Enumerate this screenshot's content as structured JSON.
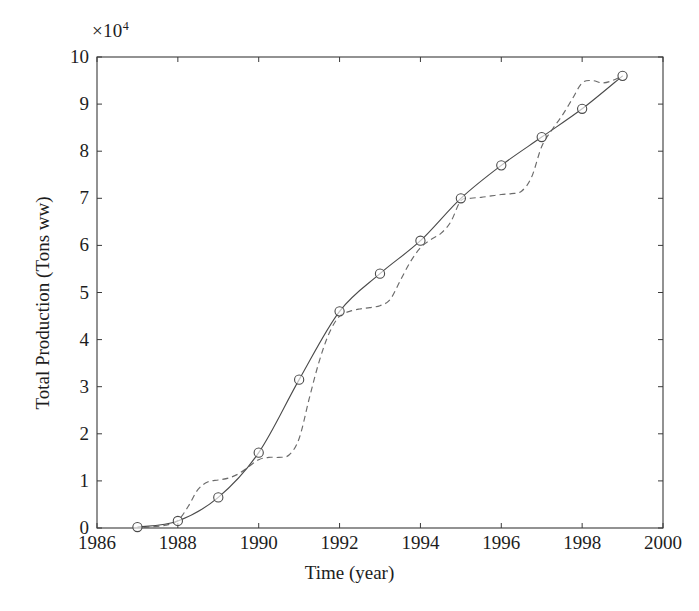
{
  "figure": {
    "exponent_label": "×10",
    "exponent_power": "4",
    "ylabel": "Total Production (Tons ww)",
    "xlabel": "Time (year)"
  },
  "chart_data": {
    "type": "line",
    "title": "",
    "xlabel": "Time (year)",
    "ylabel": "Total Production (Tons ww)",
    "y_multiplier": "×10^4",
    "xlim": [
      1986,
      2000
    ],
    "ylim": [
      0,
      10
    ],
    "xticks": [
      1986,
      1988,
      1990,
      1992,
      1994,
      1996,
      1998,
      2000
    ],
    "xtick_labels": [
      "1986",
      "1988",
      "1990",
      "1992",
      "1994",
      "1996",
      "1998",
      "2000"
    ],
    "yticks": [
      0,
      1,
      2,
      3,
      4,
      5,
      6,
      7,
      8,
      9,
      10
    ],
    "ytick_labels": [
      "0",
      "1",
      "2",
      "3",
      "4",
      "5",
      "6",
      "7",
      "8",
      "9",
      "10"
    ],
    "grid": false,
    "legend": null,
    "series": [
      {
        "name": "observed",
        "style": "solid-line-with-circle-markers",
        "marker": "circle-open",
        "color": "#4a4a4a",
        "x": [
          1987,
          1988,
          1989,
          1990,
          1991,
          1992,
          1993,
          1994,
          1995,
          1996,
          1997,
          1998,
          1999
        ],
        "values": [
          0.02,
          0.15,
          0.65,
          1.6,
          3.15,
          4.6,
          5.4,
          6.1,
          7.0,
          7.7,
          8.3,
          8.9,
          9.6
        ]
      },
      {
        "name": "model",
        "style": "dashed-line",
        "marker": "none",
        "color": "#6b6b6b",
        "x": [
          1986.9,
          1987.3,
          1987.7,
          1988.0,
          1988.25,
          1988.5,
          1988.75,
          1989.0,
          1989.25,
          1989.5,
          1989.75,
          1990.0,
          1990.25,
          1990.5,
          1990.75,
          1991.0,
          1991.25,
          1991.5,
          1991.75,
          1992.0,
          1992.25,
          1992.5,
          1992.75,
          1993.0,
          1993.25,
          1993.5,
          1993.75,
          1994.0,
          1994.25,
          1994.5,
          1994.75,
          1995.0,
          1995.25,
          1995.5,
          1995.75,
          1996.0,
          1996.25,
          1996.5,
          1996.75,
          1997.0,
          1997.25,
          1997.5,
          1997.75,
          1998.0,
          1998.25,
          1998.5,
          1998.75,
          1999.0
        ],
        "values": [
          0.0,
          0.02,
          0.06,
          0.16,
          0.45,
          0.82,
          0.98,
          1.02,
          1.06,
          1.15,
          1.3,
          1.45,
          1.5,
          1.5,
          1.55,
          1.9,
          2.75,
          3.55,
          4.15,
          4.5,
          4.6,
          4.65,
          4.68,
          4.72,
          4.85,
          5.25,
          5.65,
          5.95,
          6.12,
          6.25,
          6.5,
          6.95,
          7.0,
          7.02,
          7.05,
          7.08,
          7.1,
          7.15,
          7.45,
          8.1,
          8.45,
          8.75,
          9.1,
          9.45,
          9.5,
          9.45,
          9.5,
          9.6
        ]
      }
    ]
  }
}
